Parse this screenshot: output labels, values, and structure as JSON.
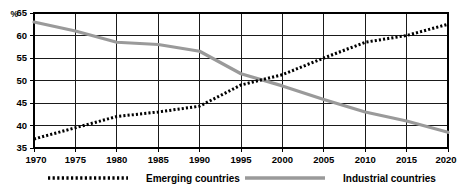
{
  "chart_data": {
    "type": "line",
    "title": "",
    "subtitle": "",
    "xlabel": "",
    "ylabel": "%",
    "unit_label": "%",
    "xlim": [
      1970,
      2020
    ],
    "ylim": [
      35,
      65
    ],
    "grid": true,
    "legend_position": "bottom",
    "x": [
      1970,
      1975,
      1980,
      1985,
      1990,
      1995,
      2000,
      2005,
      2010,
      2015,
      2020
    ],
    "xticks": [
      "1970",
      "1975",
      "1980",
      "1985",
      "1990",
      "1995",
      "2000",
      "2005",
      "2010",
      "2015",
      "2020"
    ],
    "yticks": [
      "35",
      "40",
      "45",
      "50",
      "55",
      "60",
      "65"
    ],
    "ytick_values": [
      35,
      40,
      45,
      50,
      55,
      60,
      65
    ],
    "series": [
      {
        "name": "Emerging countries",
        "style": "dotted",
        "color": "#000000",
        "values": [
          37.0,
          39.5,
          42.0,
          43.0,
          44.3,
          49.0,
          51.3,
          55.0,
          58.5,
          60.0,
          62.5
        ]
      },
      {
        "name": "Industrial countries",
        "style": "solid",
        "color": "#9a9a9a",
        "values": [
          63.0,
          61.0,
          58.5,
          58.0,
          56.5,
          51.5,
          48.8,
          45.8,
          43.0,
          41.0,
          38.5
        ]
      }
    ]
  },
  "legend": {
    "items": [
      {
        "label": "Emerging countries",
        "swatch": "dotted-line-swatch",
        "color": "#000000"
      },
      {
        "label": "Industrial countries",
        "swatch": "solid-line-swatch",
        "color": "#9a9a9a"
      }
    ]
  },
  "colors": {
    "emerging": "#000000",
    "industrial": "#9a9a9a",
    "grid": "#1a1a1a",
    "background": "#ffffff"
  }
}
